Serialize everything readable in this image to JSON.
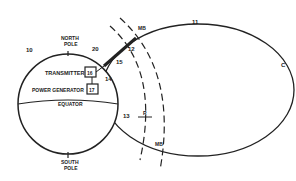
{
  "diagram": {
    "colors": {
      "ink": "#222222",
      "background": "#ffffff"
    },
    "labels": {
      "north_pole_1": "NORTH",
      "north_pole_2": "POLE",
      "south_pole_1": "SOUTH",
      "south_pole_2": "POLE",
      "equator": "EQUATOR",
      "transmitter": "TRANSMITTER",
      "transmitter_ref": "16",
      "power_generator": "POWER GENERATOR",
      "power_generator_ref": "17",
      "ref_10": "10",
      "ref_11": "11",
      "ref_12": "12",
      "ref_13": "13",
      "ref_14": "14",
      "ref_15": "15",
      "ref_20": "20",
      "ref_c": "C",
      "ref_r": "R",
      "ref_mb_top": "MB",
      "ref_mb_bottom": "MB"
    }
  }
}
